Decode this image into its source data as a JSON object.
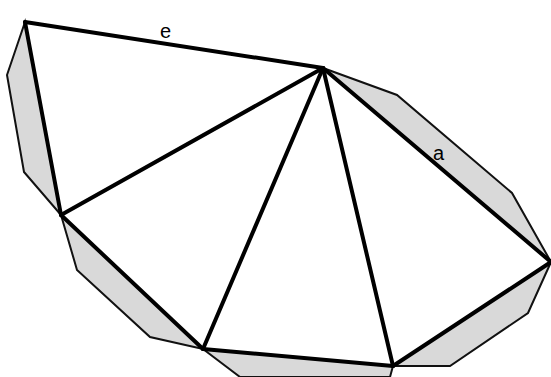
{
  "figure": {
    "colors": {
      "segment_fill": "#d9d9d9",
      "line": "#000000",
      "background": "#ffffff"
    },
    "labels": {
      "top_edge": "e",
      "right_upper_edge": "a"
    }
  }
}
